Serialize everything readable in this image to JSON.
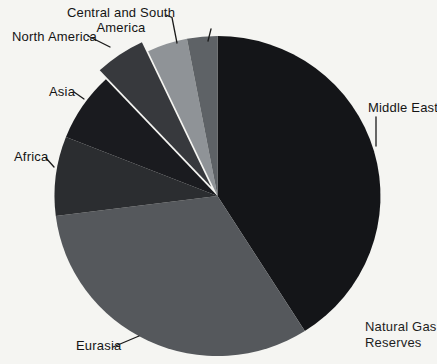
{
  "chart_data": {
    "type": "pie",
    "title": "Natural Gas Reserves",
    "values_are_percent": true,
    "start_angle_deg": 0,
    "direction": "clockwise",
    "legend": "none (direct callout labels with leader lines)",
    "background_color": "#f5f5f2",
    "text_color": "#141414",
    "slices": [
      {
        "label": "Middle East",
        "value": 41,
        "color": "#141518",
        "exploded": false
      },
      {
        "label": "Eurasia",
        "value": 32,
        "color": "#55585c",
        "exploded": false
      },
      {
        "label": "Africa",
        "value": 8,
        "color": "#2b2d30",
        "exploded": false
      },
      {
        "label": "Asia",
        "value": 7,
        "color": "#1a1b1f",
        "exploded": false
      },
      {
        "label": "North America",
        "value": 5,
        "color": "#37393d",
        "exploded": true
      },
      {
        "label": "Central and South America",
        "value": 4,
        "color": "#8f9397",
        "exploded": false
      },
      {
        "label": "Europe",
        "value": 3,
        "color": "#5e6266",
        "exploded": false
      }
    ]
  },
  "caption": {
    "line1": "Natural Gas",
    "line2": "Reserves"
  }
}
